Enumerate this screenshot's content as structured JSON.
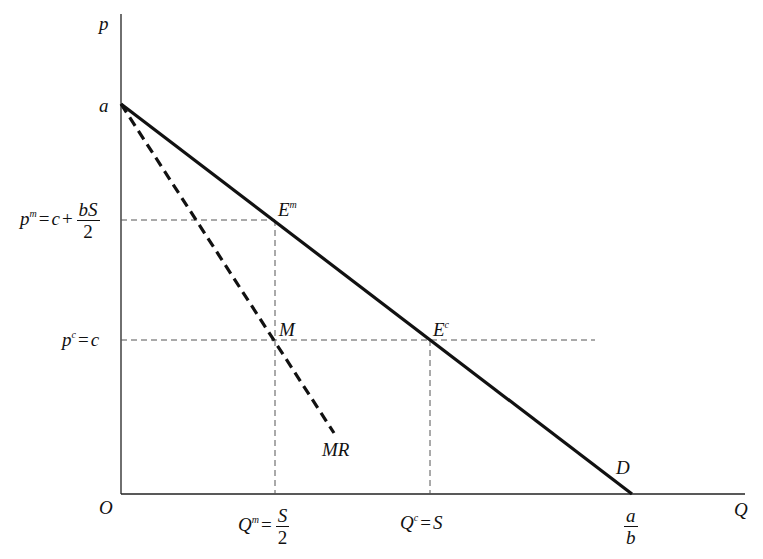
{
  "diagram": {
    "type": "monopoly vs competition linear demand diagram",
    "axes": {
      "y_label": "p",
      "x_label": "Q",
      "origin_label": "O"
    },
    "y_tick_labels": {
      "intercept": "a",
      "monopoly_price": {
        "lhs": "p",
        "sup": "m",
        "eq": "=",
        "rhs_a": "c",
        "plus": "+",
        "num": "bS",
        "den": "2"
      },
      "competitive_price": {
        "lhs": "p",
        "sup": "c",
        "eq": "=",
        "rhs": "c"
      }
    },
    "x_tick_labels": {
      "monopoly_quantity": {
        "lhs": "Q",
        "sup": "m",
        "eq": "=",
        "num": "S",
        "den": "2"
      },
      "competitive_quantity": {
        "lhs": "Q",
        "sup": "c",
        "eq": "=",
        "rhs": "S"
      },
      "demand_intercept": {
        "num": "a",
        "den": "b"
      }
    },
    "points": {
      "monopoly_eq": {
        "base": "E",
        "sup": "m"
      },
      "mr_point": "M",
      "competitive_eq": {
        "base": "E",
        "sup": "c"
      }
    },
    "curves": {
      "demand": "D",
      "marginal_revenue": "MR"
    },
    "colors": {
      "line": "#111111",
      "guide": "#555555",
      "background": "#ffffff"
    }
  }
}
